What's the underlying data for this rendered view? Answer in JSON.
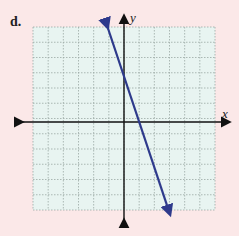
{
  "problem": {
    "label": "d."
  },
  "chart_data": {
    "type": "line",
    "title": "",
    "xlabel": "x",
    "ylabel": "y",
    "xlim": [
      -6,
      6
    ],
    "ylim": [
      -6,
      6
    ],
    "grid": true,
    "grid_style": "dotted",
    "series": [
      {
        "name": "line",
        "equation": "y = -3x + 3",
        "slope": -3,
        "intercept": 3,
        "x": [
          -1.1,
          3
        ],
        "y": [
          6.3,
          -6
        ],
        "color": "#2e3a8c",
        "arrows": "both"
      }
    ],
    "colors": {
      "background": "#fbe8e8",
      "grid_bg": "#e8f4f1",
      "grid_line": "#9aa8a4",
      "axis": "#111111",
      "line": "#2e3a8c"
    }
  }
}
